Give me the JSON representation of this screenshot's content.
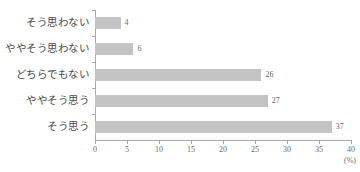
{
  "chart_data": {
    "type": "bar",
    "orientation": "horizontal",
    "title": "",
    "xlabel": "(%)",
    "ylabel": "",
    "categories": [
      "そう思わない",
      "ややそう思わない",
      "どちらでもない",
      "ややそう思う",
      "そう思う"
    ],
    "values": [
      4,
      6,
      26,
      27,
      37
    ],
    "value_labels": [
      "4",
      "6",
      "26",
      "27",
      "37"
    ],
    "xlim": [
      0,
      40
    ],
    "xticks": [
      0,
      5,
      10,
      15,
      20,
      25,
      30,
      35,
      40
    ],
    "xtick_labels": [
      "0",
      "5",
      "10",
      "15",
      "20",
      "25",
      "30",
      "35",
      "40"
    ],
    "grid": false,
    "legend": false,
    "bar_color": "#c3c3c3",
    "axis_color": "#a8a8a8",
    "text_color": "#4a4a4a",
    "background": "#ffffff"
  }
}
